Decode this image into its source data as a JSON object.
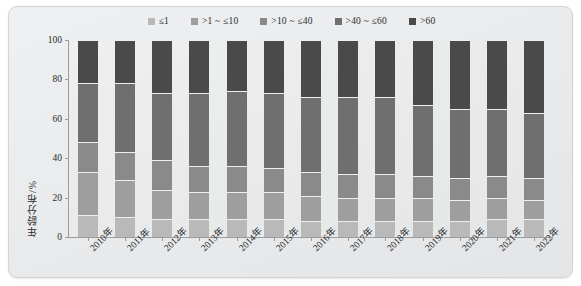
{
  "chart_data": {
    "type": "bar",
    "subtype": "stacked-bar-100-percent",
    "title": "",
    "xlabel": "",
    "ylabel": "年龄分布/%",
    "ylim": [
      0,
      100
    ],
    "yticks": [
      0,
      20,
      40,
      60,
      80,
      100
    ],
    "ytick_labels": [
      "0",
      "20",
      "40",
      "60",
      "80",
      "100"
    ],
    "grid": false,
    "legend_position": "top-center",
    "categories": [
      "2010年",
      "2011年",
      "2012年",
      "2013年",
      "2014年",
      "2015年",
      "2016年",
      "2017年",
      "2018年",
      "2019年",
      "2020年",
      "2021年",
      "2022年"
    ],
    "series": [
      {
        "name": "≤1",
        "color": "#b9b9b9",
        "values": [
          11,
          10,
          9,
          9,
          9,
          9,
          8,
          8,
          8,
          8,
          8,
          9,
          9
        ]
      },
      {
        "name": ">1 ~ ≤10",
        "color": "#9e9e9e",
        "values": [
          22,
          19,
          15,
          14,
          14,
          14,
          13,
          12,
          12,
          12,
          11,
          11,
          10
        ]
      },
      {
        "name": ">10 ~ ≤40",
        "color": "#8a8a8a",
        "values": [
          15,
          14,
          15,
          13,
          13,
          12,
          12,
          12,
          12,
          11,
          11,
          11,
          11
        ]
      },
      {
        "name": ">40 ~ ≤60",
        "color": "#6f6f6f",
        "values": [
          30,
          35,
          34,
          37,
          38,
          38,
          38,
          39,
          39,
          36,
          35,
          34,
          33
        ]
      },
      {
        "name": ">60",
        "color": "#4a4a4a",
        "values": [
          22,
          22,
          27,
          27,
          26,
          27,
          29,
          29,
          29,
          33,
          35,
          35,
          37
        ]
      }
    ]
  },
  "legend": {
    "items": [
      {
        "label": "≤1",
        "color": "#b9b9b9"
      },
      {
        "label": ">1 ~ ≤10",
        "color": "#9e9e9e"
      },
      {
        "label": ">10 ~ ≤40",
        "color": "#8a8a8a"
      },
      {
        "label": ">40 ~ ≤60",
        "color": "#6f6f6f"
      },
      {
        "label": ">60",
        "color": "#4a4a4a"
      }
    ]
  }
}
